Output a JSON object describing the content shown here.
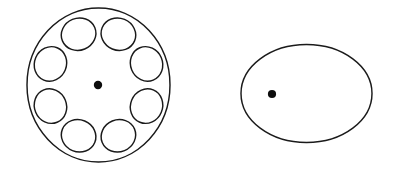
{
  "figure": {
    "background_color": "#ffffff",
    "stroke_color": "#1a1a1a",
    "dot_color": "#0d0d0d",
    "stroke_width": 1.45,
    "caption": "",
    "shapes": [
      {
        "id": "flower-figure",
        "label": "circle with eight ring petals",
        "main_circle": {
          "cx": 98.5,
          "cy": 85,
          "rx": 71.5,
          "ry": 77
        },
        "petal_ring": {
          "count": 8,
          "ring_radius_x": 52,
          "ring_radius_y": 55,
          "petal_rx": 17.5,
          "petal_ry": 16,
          "start_angle_deg": -67.5,
          "angle_step_deg": 45
        },
        "center_dot": {
          "cx": 98,
          "cy": 85,
          "r": 4.2
        }
      },
      {
        "id": "plain-ellipse-figure",
        "label": "plain ellipse with offset dot",
        "main_circle": {
          "cx": 306.5,
          "cy": 93.5,
          "rx": 65.5,
          "ry": 49
        },
        "center_dot": {
          "cx": 272,
          "cy": 94,
          "r": 4.1
        }
      }
    ]
  }
}
